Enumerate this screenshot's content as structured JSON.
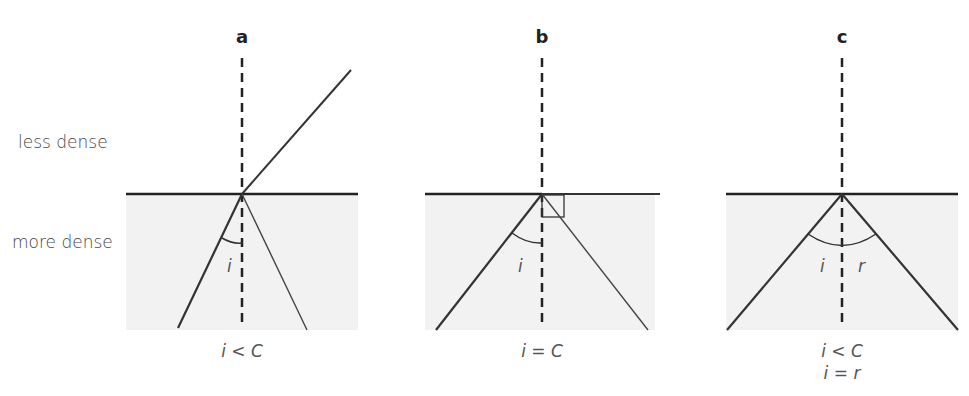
{
  "media": {
    "upper_label": "less dense",
    "lower_label": "more dense"
  },
  "panels": [
    {
      "letter": "a",
      "angle_label": "i",
      "caption_line1": "i < C",
      "caption_line2": ""
    },
    {
      "letter": "b",
      "angle_label": "i",
      "caption_line1": "i = C",
      "caption_line2": ""
    },
    {
      "letter": "c",
      "angle_label_incident": "i",
      "angle_label_reflected": "r",
      "caption_line1": "i < C",
      "caption_line2": "i = r"
    }
  ],
  "colors": {
    "ray": "#333333",
    "boundary": "#222222",
    "dense_fill": "#f2f2f2"
  }
}
